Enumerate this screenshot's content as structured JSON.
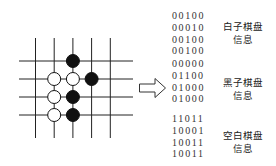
{
  "board": {
    "cols": 5,
    "rows": 4,
    "stones": [
      {
        "color": "black",
        "col": 2,
        "row": 0
      },
      {
        "color": "white",
        "col": 1,
        "row": 1
      },
      {
        "color": "white",
        "col": 2,
        "row": 1
      },
      {
        "color": "black",
        "col": 3,
        "row": 1
      },
      {
        "color": "white",
        "col": 1,
        "row": 2
      },
      {
        "color": "black",
        "col": 2,
        "row": 2
      },
      {
        "color": "white",
        "col": 1,
        "row": 3
      },
      {
        "color": "black",
        "col": 2,
        "row": 3
      }
    ],
    "colors": {
      "line": "#222222",
      "black_stone": "#111111",
      "white_stone": "#ffffff"
    }
  },
  "arrow_icon": "hollow-right-arrow",
  "matrices": [
    {
      "name": "white",
      "rows": [
        "00100",
        "00010",
        "00100",
        "00100"
      ],
      "label_line1": "白子棋盘",
      "label_line2": "信息"
    },
    {
      "name": "black",
      "rows": [
        "00000",
        "01100",
        "01000",
        "01000"
      ],
      "label_line1": "黑子棋盘",
      "label_line2": "信息"
    },
    {
      "name": "empty",
      "rows": [
        "11011",
        "10001",
        "10011",
        "10011"
      ],
      "label_line1": "空白棋盘",
      "label_line2": "信息"
    }
  ]
}
